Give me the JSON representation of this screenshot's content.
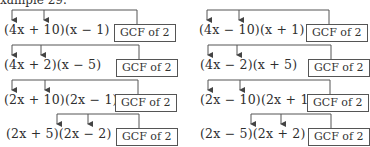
{
  "header": {
    "text": "xample 29."
  },
  "left_column": [
    {
      "expression": "(4x + 10)(x − 1)",
      "label": "GCF of 2"
    },
    {
      "expression": "(4x + 2)(x − 5)",
      "label": "GCF of 2"
    },
    {
      "expression": "(2x + 10)(2x − 1)",
      "label": "GCF of 2"
    },
    {
      "expression": "(2x + 5)(2x − 2)",
      "label": "GCF of 2"
    }
  ],
  "right_column": [
    {
      "expression": "(4x − 10)(x + 1)",
      "label": "GCF of 2"
    },
    {
      "expression": "(4x − 2)(x + 5)",
      "label": "GCF of 2"
    },
    {
      "expression": "(2x − 10)(2x + 1)",
      "label": "GCF of 2"
    },
    {
      "expression": "(2x − 5)(2x + 2)",
      "label": "GCF of 2"
    }
  ],
  "colors": {
    "line": "#555555",
    "text": "#2e2e2e"
  }
}
